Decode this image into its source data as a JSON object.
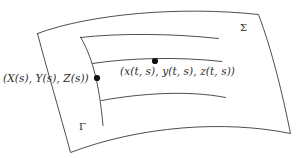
{
  "figure": {
    "type": "parametrized-surface-diagram",
    "background_color": "#ffffff",
    "stroke_color": "#3a3a3a",
    "dot_color": "#111111",
    "labels": {
      "surface": "Σ",
      "initial_curve": "Γ",
      "curve_point": "(X(s), Y(s), Z(s))",
      "surface_point": "(x(t, s), y(t, s), z(t, s))"
    },
    "points": [
      {
        "name": "curve-point",
        "x": 97,
        "y": 78,
        "radius": 3.1
      },
      {
        "name": "surface-point",
        "x": 155,
        "y": 61,
        "radius": 3.1
      }
    ],
    "surface_outline": "M 37.5 33.5 C 90 14, 180 6, 258.5 14.5 C 272 50, 283 96, 290.5 133.5 C 225 120, 140 126, 70.5 152.5 C 60 113, 47 70, 37.5 33.5 Z",
    "characteristic_curves": [
      "M 80.5 37.5 C 120 33, 172 33.5, 218.5 38.5",
      "M 92.5 63.5 C 128 58, 178 56.5, 222 61.5",
      "M 101.5 100.5 C 140 93.5, 188 90, 225.5 97.5"
    ],
    "initial_curve_path": "M 80.5 37 C 91 55, 99 80, 103 125.5"
  }
}
